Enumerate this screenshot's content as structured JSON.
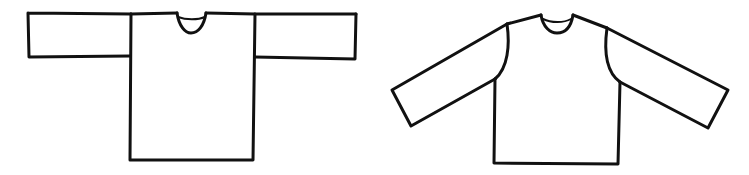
{
  "figure": {
    "stroke_color": "#111111",
    "background_color": "#ffffff",
    "stroke_width": 3
  },
  "garments": [
    {
      "name": "t-shaped-tunic",
      "style": "straight sleeves, T-shaped construction"
    },
    {
      "name": "angled-sleeve-shirt",
      "style": "set-in angled sleeves with curved armholes"
    }
  ]
}
